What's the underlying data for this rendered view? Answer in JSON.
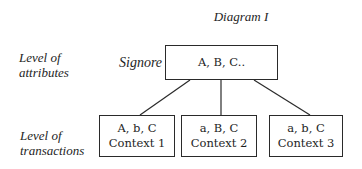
{
  "diagram": {
    "title": "Diagram I",
    "levels": {
      "attributes": [
        "Level of",
        "attributes"
      ],
      "transactions": [
        "Level of",
        "transactions"
      ]
    },
    "root": {
      "label": "Signore",
      "content": "A, B, C.."
    },
    "children": [
      {
        "attrs": "A, b, C",
        "context": "Context 1"
      },
      {
        "attrs": "a, B, C",
        "context": "Context 2"
      },
      {
        "attrs": "a, b, C",
        "context": "Context 3"
      }
    ],
    "colors": {
      "line": "#2a2a2a",
      "background": "#ffffff",
      "text": "#1e1e1e"
    }
  }
}
